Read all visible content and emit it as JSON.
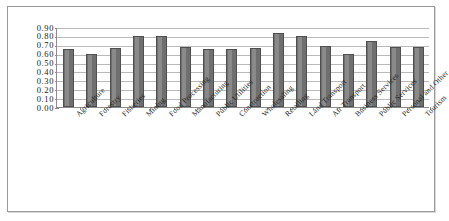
{
  "chart_data": {
    "type": "bar",
    "title": "",
    "subtitle": "",
    "xlabel": "",
    "ylabel": "",
    "ylim": [
      0.0,
      0.9
    ],
    "ytick_labels": [
      "0.90",
      "0.80",
      "0.70",
      "0.60",
      "0.50",
      "0.40",
      "0.30",
      "0.20",
      "0.10",
      "0.00"
    ],
    "ytick_values": [
      0.9,
      0.8,
      0.7,
      0.6,
      0.5,
      0.4,
      0.3,
      0.2,
      0.1,
      0.0
    ],
    "grid": true,
    "legend": false,
    "legend_position": "none",
    "bar_color": "#7b7b7b",
    "bar_edge_color": "#4f4f4f",
    "plot_background": "#ffffff",
    "frame_border_color": "#9a9a9a",
    "categories": [
      "Agriculture",
      "Forestry",
      "Fisheries",
      "Mining",
      "Food Processing",
      "Manufacturing",
      "Public Utilities",
      "Construction",
      "Wholesaling",
      "Retailing",
      "Land Transport",
      "Air Transport",
      "Business  Services",
      "Public Services",
      "Personal and Other ...",
      "Tourism"
    ],
    "values": [
      0.655,
      0.6,
      0.665,
      0.8,
      0.8,
      0.675,
      0.655,
      0.655,
      0.66,
      0.83,
      0.795,
      0.685,
      0.595,
      0.745,
      0.675,
      0.68
    ]
  }
}
